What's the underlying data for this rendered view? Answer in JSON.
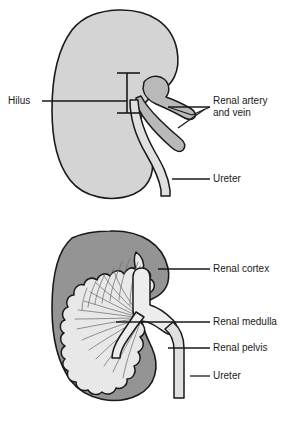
{
  "figure": {
    "background_color": "#ffffff",
    "outline_color": "#1a1a1a",
    "leader_color": "#1a1a1a"
  },
  "palette": {
    "kidney_body_fill": "#d4d4d4",
    "cortex_fill": "#949494",
    "medulla_fill": "#e8e8e8",
    "pelvis_fill": "#ededed",
    "vessel_fill": "#b9b9b9",
    "ureter_fill": "#e0e0e0",
    "text_color": "#1a1a1a"
  },
  "panels": [
    {
      "id": "external-view",
      "name": "External kidney view",
      "labels": [
        {
          "id": "hilus",
          "text": "Hilus",
          "lines": [
            "Hilus"
          ],
          "anchor": "left",
          "text_x": 8,
          "text_y": 104,
          "leader": {
            "x1": 42,
            "y1": 101,
            "x2": 127,
            "y2": 101
          }
        },
        {
          "id": "renal-artery-and-vein",
          "text": "Renal artery and vein",
          "lines": [
            "Renal artery",
            "and vein"
          ],
          "anchor": "right",
          "text_x": 213,
          "text_y": 104,
          "leader": {
            "x1": 168,
            "y1": 107,
            "x2": 210,
            "y2": 107
          }
        },
        {
          "id": "ureter-external",
          "text": "Ureter",
          "lines": [
            "Ureter"
          ],
          "anchor": "right",
          "text_x": 213,
          "text_y": 182,
          "leader": {
            "x1": 176,
            "y1": 179,
            "x2": 210,
            "y2": 179
          }
        }
      ]
    },
    {
      "id": "sectional-view",
      "name": "Sectioned kidney view",
      "labels": [
        {
          "id": "renal-cortex",
          "text": "Renal cortex",
          "lines": [
            "Renal cortex"
          ],
          "anchor": "right",
          "text_x": 213,
          "text_y": 272,
          "leader": {
            "x1": 158,
            "y1": 269,
            "x2": 210,
            "y2": 269
          }
        },
        {
          "id": "renal-medulla",
          "text": "Renal medulla",
          "lines": [
            "Renal medulla"
          ],
          "anchor": "right",
          "text_x": 213,
          "text_y": 325,
          "leader": {
            "x1": 116,
            "y1": 322,
            "x2": 210,
            "y2": 322
          }
        },
        {
          "id": "renal-pelvis",
          "text": "Renal pelvis",
          "lines": [
            "Renal pelvis"
          ],
          "anchor": "right",
          "text_x": 213,
          "text_y": 351,
          "leader": {
            "x1": 168,
            "y1": 348,
            "x2": 210,
            "y2": 348
          }
        },
        {
          "id": "ureter-sectional",
          "text": "Ureter",
          "lines": [
            "Ureter"
          ],
          "anchor": "right",
          "text_x": 213,
          "text_y": 379,
          "leader": {
            "x1": 190,
            "y1": 376,
            "x2": 210,
            "y2": 376
          }
        }
      ]
    }
  ]
}
